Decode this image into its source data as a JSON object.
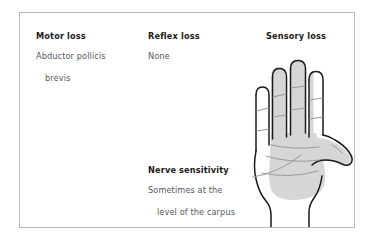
{
  "card": {
    "border_color": "#bcbcbc",
    "background": "#ffffff"
  },
  "columns": {
    "motor": {
      "heading": "Motor loss",
      "line1": "Abductor pollicis",
      "line2": "brevis"
    },
    "reflex": {
      "heading": "Reflex loss",
      "line1": "None"
    },
    "sensory": {
      "heading": "Sensory loss"
    },
    "nerve": {
      "heading": "Nerve sensitivity",
      "line1": "Sometimes at the",
      "line2": "level of the carpus"
    }
  },
  "illustration": {
    "name": "hand-palm-diagram",
    "shaded_region_label": "median-nerve-sensory-distribution",
    "shade_color": "#d6d6d6",
    "outline_color": "#1a1a1a",
    "crease_color": "#9a9a9a"
  }
}
